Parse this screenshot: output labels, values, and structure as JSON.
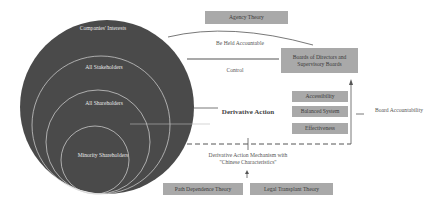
{
  "circles": {
    "outer": "Companies' Interests",
    "second": "All Stakeholders",
    "third": "All Shareholders",
    "inner": "Minority Shareholders"
  },
  "boxes": {
    "agency_theory": "Agency Theory",
    "boards": "Boards of Directors and Supervisory Boards",
    "accessibility": "Accessibility",
    "balanced_system": "Balanced System",
    "effectiveness": "Effectiveness",
    "path_dependence": "Path Dependence Theory",
    "legal_transplant": "Legal Transplant Theory"
  },
  "labels": {
    "be_held_accountable": "Be Held Accountable",
    "control": "Control",
    "derivative_action": "Derivative Action",
    "mechanism": "Derivative Action Mechanism with \"Chinese Characteristics\"",
    "board_accountability": "Board Accountability"
  },
  "colors": {
    "circle_fill": "#4a4a4a",
    "box_fill": "#a9a9a9",
    "line": "#555555"
  }
}
